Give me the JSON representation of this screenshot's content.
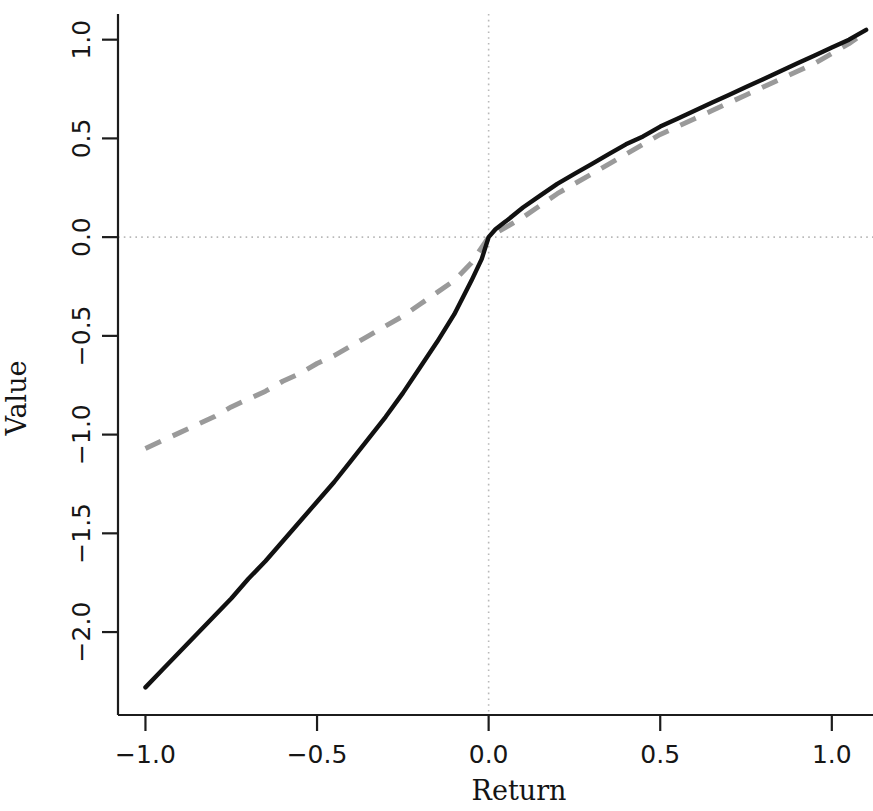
{
  "chart_data": {
    "type": "line",
    "title": "",
    "subtitle": "",
    "xlabel": "Return",
    "ylabel": "Value",
    "xlim": [
      -1.08,
      1.12
    ],
    "ylim": [
      -2.42,
      1.13
    ],
    "xticks": [
      -1.0,
      -0.5,
      0.0,
      0.5,
      1.0
    ],
    "xticklabels": [
      "-1.0",
      "-0.5",
      "0.0",
      "0.5",
      "1.0"
    ],
    "yticks": [
      -2.0,
      -1.5,
      -1.0,
      -0.5,
      0.0,
      0.5,
      1.0
    ],
    "yticklabels": [
      "-2.0",
      "-1.5",
      "-1.0",
      "-0.5",
      "0.0",
      "0.5",
      "1.0"
    ],
    "grid": false,
    "reference_lines": [
      {
        "name": "zero-vertical",
        "axis": "x",
        "value": 0.0,
        "style": "dotted",
        "color": "#b9b9b9"
      },
      {
        "name": "zero-horizontal",
        "axis": "y",
        "value": 0.0,
        "style": "dotted",
        "color": "#b9b9b9"
      }
    ],
    "legend": {
      "visible": false,
      "position": "none"
    },
    "series": [
      {
        "name": "value-function-loss-averse",
        "style": "solid",
        "color": "#111111",
        "x": [
          -1.0,
          -0.95,
          -0.9,
          -0.85,
          -0.8,
          -0.75,
          -0.7,
          -0.65,
          -0.6,
          -0.55,
          -0.5,
          -0.45,
          -0.4,
          -0.35,
          -0.3,
          -0.25,
          -0.2,
          -0.15,
          -0.1,
          -0.05,
          -0.02,
          0.0,
          0.02,
          0.05,
          0.1,
          0.15,
          0.2,
          0.25,
          0.3,
          0.35,
          0.4,
          0.45,
          0.5,
          0.55,
          0.6,
          0.65,
          0.7,
          0.75,
          0.8,
          0.85,
          0.9,
          0.95,
          1.0,
          1.05,
          1.1
        ],
        "y": [
          -2.28,
          -2.19,
          -2.1,
          -2.01,
          -1.92,
          -1.83,
          -1.73,
          -1.64,
          -1.54,
          -1.44,
          -1.34,
          -1.24,
          -1.13,
          -1.02,
          -0.91,
          -0.79,
          -0.66,
          -0.53,
          -0.39,
          -0.22,
          -0.11,
          0.0,
          0.04,
          0.08,
          0.15,
          0.21,
          0.27,
          0.32,
          0.37,
          0.42,
          0.47,
          0.51,
          0.56,
          0.6,
          0.64,
          0.68,
          0.72,
          0.76,
          0.8,
          0.84,
          0.88,
          0.92,
          0.96,
          1.0,
          1.05
        ]
      },
      {
        "name": "value-function-reference",
        "style": "dashed",
        "color": "#9a9a9a",
        "x": [
          -1.0,
          -0.95,
          -0.9,
          -0.85,
          -0.8,
          -0.75,
          -0.7,
          -0.65,
          -0.6,
          -0.55,
          -0.5,
          -0.45,
          -0.4,
          -0.35,
          -0.3,
          -0.25,
          -0.2,
          -0.15,
          -0.1,
          -0.05,
          0.0,
          0.05,
          0.1,
          0.15,
          0.2,
          0.25,
          0.3,
          0.35,
          0.4,
          0.45,
          0.5,
          0.55,
          0.6,
          0.65,
          0.7,
          0.75,
          0.8,
          0.85,
          0.9,
          0.95,
          1.0,
          1.05,
          1.1
        ],
        "y": [
          -1.07,
          -1.03,
          -0.99,
          -0.95,
          -0.91,
          -0.86,
          -0.82,
          -0.78,
          -0.73,
          -0.69,
          -0.64,
          -0.6,
          -0.55,
          -0.5,
          -0.45,
          -0.4,
          -0.34,
          -0.28,
          -0.22,
          -0.13,
          0.0,
          0.05,
          0.1,
          0.16,
          0.22,
          0.27,
          0.32,
          0.37,
          0.42,
          0.47,
          0.52,
          0.56,
          0.6,
          0.64,
          0.68,
          0.72,
          0.76,
          0.8,
          0.84,
          0.88,
          0.93,
          0.98,
          1.04
        ]
      }
    ]
  },
  "figure": {
    "background_color": "#ffffff",
    "axis_color": "#1c1c1c"
  }
}
